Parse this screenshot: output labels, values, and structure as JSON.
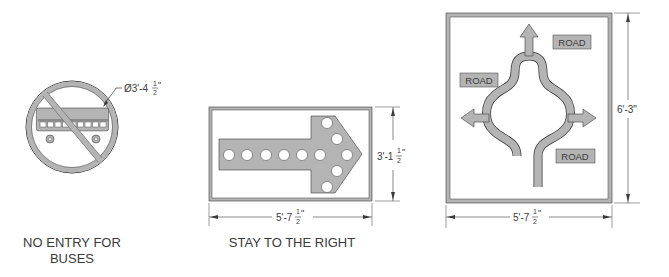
{
  "colors": {
    "sign_fill": "#b4b4b4",
    "line": "#3a3a3a",
    "background": "#ffffff"
  },
  "signs": [
    {
      "id": "no-entry-buses",
      "caption_line1": "NO ENTRY FOR",
      "caption_line2": "BUSES",
      "diameter_label": "Ø3'-4",
      "diameter_frac_num": "1",
      "diameter_frac_den": "2",
      "diameter_inch": "\""
    },
    {
      "id": "stay-right",
      "caption": "STAY TO THE RIGHT",
      "width_label": "5'-7",
      "width_frac_num": "1",
      "width_frac_den": "2",
      "width_inch": "\"",
      "height_label": "3'-1",
      "height_frac_num": "1",
      "height_frac_den": "2",
      "height_inch": "\""
    },
    {
      "id": "roundabout",
      "road_labels": [
        "ROAD",
        "ROAD",
        "ROAD"
      ],
      "width_label": "5'-7",
      "width_frac_num": "1",
      "width_frac_den": "2",
      "width_inch": "\"",
      "height_label": "6'-3\""
    }
  ]
}
